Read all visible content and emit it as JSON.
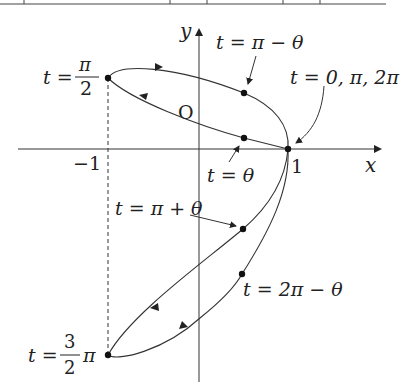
{
  "diagram": {
    "type": "parametric-curve",
    "axes": {
      "x_label": "x",
      "y_label": "y",
      "origin_label": "O",
      "tick_neg1": "−1",
      "tick_1": "1"
    },
    "points": [
      {
        "id": "t_pi_over_2",
        "label_prefix": "t =",
        "frac_num": "π",
        "frac_den": "2"
      },
      {
        "id": "t_pi_minus_theta",
        "label": "t = π − θ"
      },
      {
        "id": "t_zero",
        "label": "t = 0, π, 2π"
      },
      {
        "id": "t_theta",
        "label": "t = θ"
      },
      {
        "id": "t_pi_plus_theta",
        "label": "t = π + θ"
      },
      {
        "id": "t_2pi_minus_theta",
        "label": "t = 2π − θ"
      },
      {
        "id": "t_3pi_over_2",
        "label_prefix": "t =",
        "frac_num": "3",
        "frac_den": "2",
        "label_suffix": "π"
      }
    ],
    "colors": {
      "line": "#333333",
      "text": "#222222",
      "background": "#ffffff"
    }
  }
}
